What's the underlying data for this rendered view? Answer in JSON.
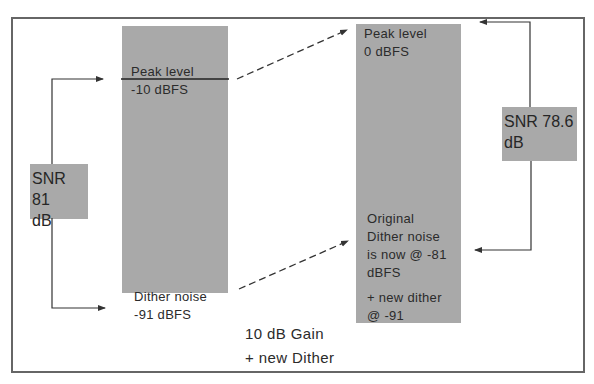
{
  "diagram": {
    "colors": {
      "bar": "#a9a9a9",
      "line": "#333333",
      "frame": "#666666",
      "background": "#ffffff"
    },
    "left_bar": {
      "peak_label": "Peak level",
      "peak_value": "-10  dBFS",
      "noise_label": "Dither  noise",
      "noise_value": "-91  dBFS"
    },
    "left_snr": {
      "line1": "SNR 81",
      "line2": "dB"
    },
    "right_bar": {
      "peak_label": "Peak level",
      "peak_value": "0 dBFS",
      "noise_lines": [
        "Original",
        "Dither noise",
        "is now @ -81",
        "dBFS"
      ],
      "new_dither_lines": [
        "+ new dither",
        "@  -91"
      ]
    },
    "right_snr": {
      "line1": "SNR 78.6",
      "line2": "dB"
    },
    "caption": {
      "line1": "10 dB Gain",
      "line2": "+ new  Dither"
    }
  }
}
